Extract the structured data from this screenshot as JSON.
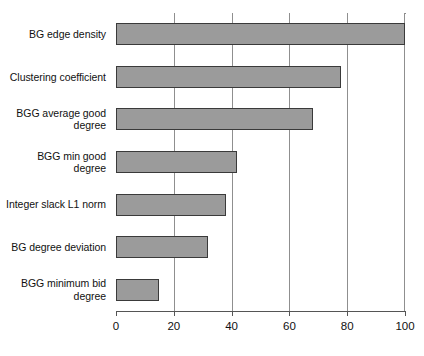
{
  "chart_data": {
    "type": "bar",
    "orientation": "horizontal",
    "title": "",
    "subtitle": "",
    "xlabel": "",
    "ylabel": "",
    "xlim": [
      0,
      100
    ],
    "ylim": null,
    "grid": true,
    "legend": null,
    "legend_position": "none",
    "bar_fill_color": "#9b9b9b",
    "bar_edge_color": "#3a3a3a",
    "axis_color": "#555555",
    "gridline_color": "#8f8f8f",
    "background_color": "#ffffff",
    "xticks": [
      0,
      20,
      40,
      60,
      80,
      100
    ],
    "xtick_labels": [
      "0",
      "20",
      "40",
      "60",
      "80",
      "100"
    ],
    "categories": [
      "BG edge density",
      "Clustering coefficient",
      "BGG average good\ndegree",
      "BGG min good\ndegree",
      "Integer slack L1 norm",
      "BG degree deviation",
      "BGG minimum bid\ndegree"
    ],
    "values": [
      100,
      78,
      68,
      42,
      38,
      32,
      15
    ],
    "series": [
      {
        "name": "importance",
        "values": [
          100,
          78,
          68,
          42,
          38,
          32,
          15
        ]
      }
    ]
  }
}
